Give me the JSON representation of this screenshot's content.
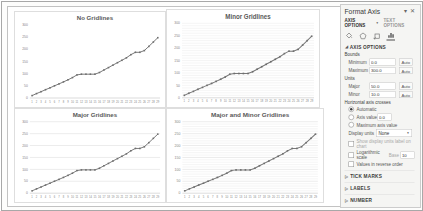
{
  "colors": {
    "series_line": "#787878",
    "marker": "#6e6e6e",
    "major_gridline": "#d4d4d4",
    "minor_gridline": "#e8e8e8",
    "chart_title_text": "#595959",
    "pane_background": "#f5f5f3"
  },
  "icons": {
    "pane_menu": "▾",
    "close": "✕",
    "dropdown_arrow": "▼",
    "section_expanded": "◢",
    "section_collapsed": "▷"
  },
  "pane": {
    "title": "Format Axis",
    "tabs": {
      "axis_options": "AXIS OPTIONS",
      "text_options": "TEXT OPTIONS"
    },
    "section_axis_options": "AXIS OPTIONS",
    "bounds_label": "Bounds",
    "minimum": {
      "label": "Minimum",
      "value": "0.0",
      "auto": "Auto"
    },
    "maximum": {
      "label": "Maximum",
      "value": "300.0",
      "auto": "Auto"
    },
    "units_label": "Units",
    "major": {
      "label": "Major",
      "value": "50.0",
      "auto": "Auto"
    },
    "minor": {
      "label": "Minor",
      "value": "10.0",
      "auto": "Auto"
    },
    "crosses_label": "Horizontal axis crosses",
    "crosses_auto": "Automatic",
    "crosses_value": {
      "label": "Axis value",
      "value": "0.0"
    },
    "crosses_max": "Maximum axis value",
    "display_units": {
      "label": "Display units",
      "value": "None"
    },
    "show_units_label": "Show display units label on chart",
    "log_scale": {
      "label": "Logarithmic scale",
      "base_label": "Base",
      "base_value": "10"
    },
    "reverse_label": "Values in reverse order",
    "sections": [
      "TICK MARKS",
      "LABELS",
      "NUMBER"
    ]
  },
  "chart_data": [
    {
      "type": "line",
      "title": "No Gridlines",
      "gridlines": "none",
      "categories": [
        1,
        2,
        3,
        4,
        5,
        6,
        7,
        8,
        9,
        10,
        11,
        12,
        13,
        14,
        15,
        16,
        17,
        18,
        19,
        20,
        21,
        22,
        23,
        24,
        25,
        26,
        27,
        28,
        29
      ],
      "values": [
        10,
        18,
        26,
        34,
        42,
        50,
        58,
        66,
        75,
        84,
        95,
        98,
        98,
        98,
        98,
        105,
        115,
        125,
        135,
        145,
        155,
        165,
        178,
        188,
        188,
        195,
        212,
        230,
        248
      ],
      "xlabel": "",
      "ylabel": "",
      "ylim": [
        0,
        300
      ],
      "major_unit": 50,
      "minor_unit": 10,
      "legend": "none"
    },
    {
      "type": "line",
      "title": "Minor Gridlines",
      "gridlines": "minor",
      "categories": [
        1,
        2,
        3,
        4,
        5,
        6,
        7,
        8,
        9,
        10,
        11,
        12,
        13,
        14,
        15,
        16,
        17,
        18,
        19,
        20,
        21,
        22,
        23,
        24,
        25,
        26,
        27,
        28,
        29
      ],
      "values": [
        10,
        18,
        26,
        34,
        42,
        50,
        58,
        66,
        75,
        84,
        95,
        98,
        98,
        98,
        98,
        105,
        115,
        125,
        135,
        145,
        155,
        165,
        178,
        188,
        188,
        195,
        212,
        230,
        248
      ],
      "xlabel": "",
      "ylabel": "",
      "ylim": [
        0,
        300
      ],
      "major_unit": 50,
      "minor_unit": 10,
      "legend": "none"
    },
    {
      "type": "line",
      "title": "Major Gridlines",
      "gridlines": "major",
      "categories": [
        1,
        2,
        3,
        4,
        5,
        6,
        7,
        8,
        9,
        10,
        11,
        12,
        13,
        14,
        15,
        16,
        17,
        18,
        19,
        20,
        21,
        22,
        23,
        24,
        25,
        26,
        27,
        28,
        29
      ],
      "values": [
        10,
        18,
        26,
        34,
        42,
        50,
        58,
        66,
        75,
        84,
        95,
        98,
        98,
        98,
        98,
        105,
        115,
        125,
        135,
        145,
        155,
        165,
        178,
        188,
        188,
        195,
        212,
        230,
        248
      ],
      "xlabel": "",
      "ylabel": "",
      "ylim": [
        0,
        300
      ],
      "major_unit": 50,
      "minor_unit": 10,
      "legend": "none"
    },
    {
      "type": "line",
      "title": "Major and Minor Gridlines",
      "gridlines": "both",
      "categories": [
        1,
        2,
        3,
        4,
        5,
        6,
        7,
        8,
        9,
        10,
        11,
        12,
        13,
        14,
        15,
        16,
        17,
        18,
        19,
        20,
        21,
        22,
        23,
        24,
        25,
        26,
        27,
        28,
        29
      ],
      "values": [
        10,
        18,
        26,
        34,
        42,
        50,
        58,
        66,
        75,
        84,
        95,
        98,
        98,
        98,
        98,
        105,
        115,
        125,
        135,
        145,
        155,
        165,
        178,
        188,
        188,
        195,
        212,
        230,
        248
      ],
      "xlabel": "",
      "ylabel": "",
      "ylim": [
        0,
        300
      ],
      "major_unit": 50,
      "minor_unit": 10,
      "legend": "none"
    }
  ]
}
